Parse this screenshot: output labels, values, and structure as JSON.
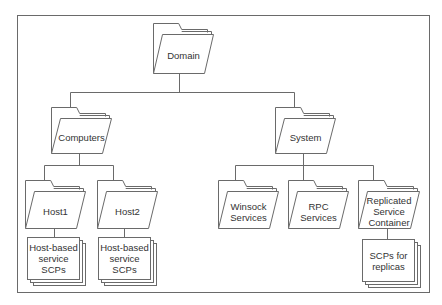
{
  "diagram": {
    "type": "hierarchy",
    "colors": {
      "line": "#6a6a6a",
      "text": "#333333",
      "background": "#ffffff"
    },
    "nodes": [
      {
        "id": "domain",
        "kind": "folder",
        "label": [
          "Domain"
        ],
        "parent": null
      },
      {
        "id": "computers",
        "kind": "folder",
        "label": [
          "Computers"
        ],
        "parent": "domain"
      },
      {
        "id": "system",
        "kind": "folder",
        "label": [
          "System"
        ],
        "parent": "domain"
      },
      {
        "id": "host1",
        "kind": "folder",
        "label": [
          "Host1"
        ],
        "parent": "computers"
      },
      {
        "id": "host2",
        "kind": "folder",
        "label": [
          "Host2"
        ],
        "parent": "computers"
      },
      {
        "id": "host1-scps",
        "kind": "document-stack",
        "label": [
          "Host-based",
          "service",
          "SCPs"
        ],
        "parent": "host1"
      },
      {
        "id": "host2-scps",
        "kind": "document-stack",
        "label": [
          "Host-based",
          "service",
          "SCPs"
        ],
        "parent": "host2"
      },
      {
        "id": "winsock",
        "kind": "folder",
        "label": [
          "Winsock",
          "Services"
        ],
        "parent": "system"
      },
      {
        "id": "rpc",
        "kind": "folder",
        "label": [
          "RPC",
          "Services"
        ],
        "parent": "system"
      },
      {
        "id": "replicated",
        "kind": "folder",
        "label": [
          "Replicated",
          "Service",
          "Container"
        ],
        "parent": "system"
      },
      {
        "id": "replica-scps",
        "kind": "document-stack",
        "label": [
          "SCPs for",
          "replicas"
        ],
        "parent": "replicated"
      }
    ]
  },
  "caption": "Figure 11-1"
}
